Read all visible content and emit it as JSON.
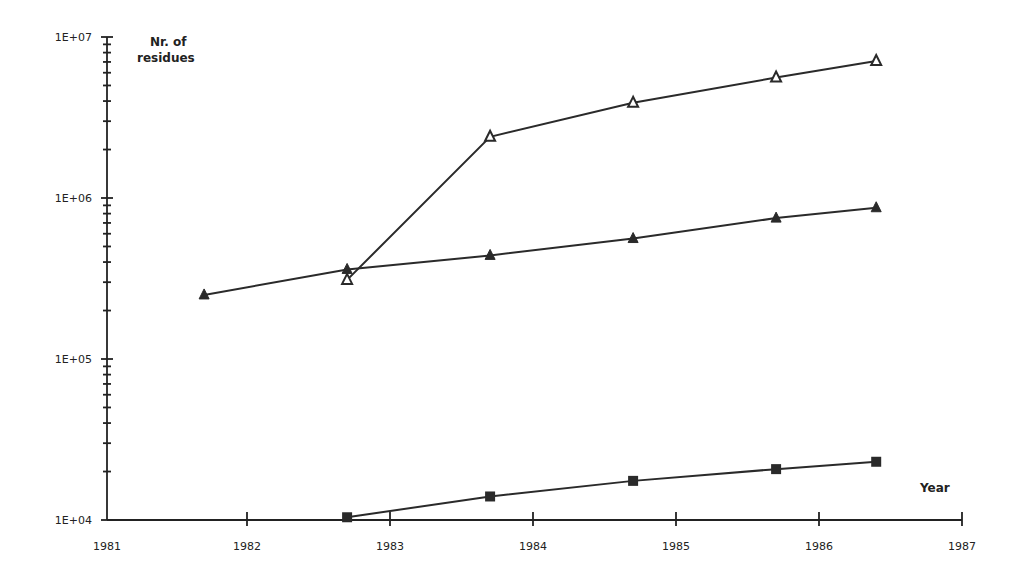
{
  "chart_data": {
    "type": "line",
    "title": "",
    "xlabel": "Year",
    "ylabel": "Nr. of residues",
    "yscale": "log",
    "xlim": [
      1981,
      1987
    ],
    "ylim": [
      10000,
      10000000
    ],
    "grid": false,
    "legend": null,
    "x_ticks": [
      "1981",
      "1982",
      "1983",
      "1984",
      "1985",
      "1986",
      "1987"
    ],
    "y_ticks": [
      "1E+04",
      "1E+05",
      "1E+06",
      "1E+07"
    ],
    "series": [
      {
        "name": "Series 1 (open triangles, upper)",
        "marker": "open-triangle",
        "x": [
          1982.7,
          1983.7,
          1984.7,
          1985.7,
          1986.4
        ],
        "values": [
          310000,
          2400000,
          3900000,
          5600000,
          7100000
        ]
      },
      {
        "name": "Series 2 (filled triangles)",
        "marker": "filled-triangle",
        "x": [
          1981.7,
          1982.7,
          1983.7,
          1984.7,
          1985.7,
          1986.4
        ],
        "values": [
          250000,
          360000,
          440000,
          560000,
          750000,
          870000
        ]
      },
      {
        "name": "Series 3 (filled squares)",
        "marker": "filled-square",
        "x": [
          1982.7,
          1983.7,
          1984.7,
          1985.7,
          1986.4
        ],
        "values": [
          10400,
          14000,
          17500,
          20700,
          23000
        ]
      }
    ]
  }
}
